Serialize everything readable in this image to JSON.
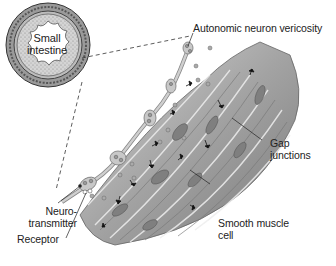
{
  "diagram": {
    "inset": {
      "label_line1": "Small",
      "label_line2": "intestine"
    },
    "labels": {
      "vericosity": "Autonomic neuron vericosity",
      "gap_line1": "Gap",
      "gap_line2": "junctions",
      "neuro_line1": "Neuro-",
      "neuro_line2": "transmitter",
      "receptor": "Receptor",
      "smooth_line1": "Smooth muscle",
      "smooth_line2": "cell"
    },
    "colors": {
      "muscle": "#9a9a9a",
      "muscle_light": "#cfcfcf",
      "muscle_dark": "#6e6e6e",
      "nucleus": "#7c7c7c",
      "neuron": "#bdbdbd",
      "line": "#222222"
    }
  }
}
